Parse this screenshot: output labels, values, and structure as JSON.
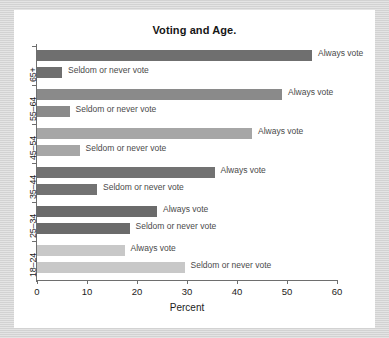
{
  "chart_data": {
    "type": "bar",
    "orientation": "horizontal",
    "title": "Voting and Age.",
    "xlabel": "Percent",
    "ylabel": "",
    "xlim": [
      0,
      60
    ],
    "xticks": [
      0,
      10,
      20,
      30,
      40,
      50,
      60
    ],
    "grid": false,
    "legend_position": "inline-bar-labels",
    "categories": [
      "18–24",
      "25–34",
      "35–44",
      "45–54",
      "55–64",
      "65+"
    ],
    "series": [
      {
        "name": "Always vote",
        "values": [
          17.5,
          24,
          35.5,
          43,
          49,
          55
        ]
      },
      {
        "name": "Seldom or never vote",
        "values": [
          29.5,
          18.5,
          12,
          8.5,
          6.5,
          5
        ]
      }
    ],
    "bar_colors": {
      "18–24": "#c8c8c8",
      "25–34": "#6b6b6b",
      "35–44": "#727272",
      "45–54": "#a6a6a6",
      "55–64": "#8a8a8a",
      "65+": "#6f6f6f"
    },
    "groups": [
      {
        "category": "65+",
        "color": "#6f6f6f",
        "bars": [
          {
            "label": "Always vote",
            "value": 55
          },
          {
            "label": "Seldom or never vote",
            "value": 5
          }
        ]
      },
      {
        "category": "55–64",
        "color": "#8a8a8a",
        "bars": [
          {
            "label": "Always vote",
            "value": 49
          },
          {
            "label": "Seldom or never vote",
            "value": 6.5
          }
        ]
      },
      {
        "category": "45–54",
        "color": "#a6a6a6",
        "bars": [
          {
            "label": "Always vote",
            "value": 43
          },
          {
            "label": "Seldom or never vote",
            "value": 8.5
          }
        ]
      },
      {
        "category": "35–44",
        "color": "#727272",
        "bars": [
          {
            "label": "Always vote",
            "value": 35.5
          },
          {
            "label": "Seldom or never vote",
            "value": 12
          }
        ]
      },
      {
        "category": "25–34",
        "color": "#6b6b6b",
        "bars": [
          {
            "label": "Always vote",
            "value": 24
          },
          {
            "label": "Seldom or never vote",
            "value": 18.5
          }
        ]
      },
      {
        "category": "18–24",
        "color": "#c8c8c8",
        "bars": [
          {
            "label": "Always vote",
            "value": 17.5
          },
          {
            "label": "Seldom or never vote",
            "value": 29.5
          }
        ]
      }
    ]
  }
}
